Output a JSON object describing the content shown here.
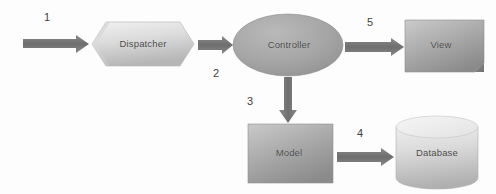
{
  "diagram": {
    "background_color": "#fdfdfd",
    "arrow_color": "#6b6b6b",
    "text_color": "#4a4a4a",
    "nodes": [
      {
        "id": "dispatcher",
        "label": "Dispatcher",
        "shape": "hexagon"
      },
      {
        "id": "controller",
        "label": "Controller",
        "shape": "ellipse"
      },
      {
        "id": "view",
        "label": "View",
        "shape": "box-3d"
      },
      {
        "id": "model",
        "label": "Model",
        "shape": "rectangle"
      },
      {
        "id": "database",
        "label": "Database",
        "shape": "cylinder"
      }
    ],
    "connectors": [
      {
        "id": "arrow-1",
        "number": "1",
        "from": "input",
        "to": "dispatcher",
        "direction": "right"
      },
      {
        "id": "arrow-2",
        "number": "2",
        "from": "dispatcher",
        "to": "controller",
        "direction": "right"
      },
      {
        "id": "arrow-3",
        "number": "3",
        "from": "controller",
        "to": "model",
        "direction": "down"
      },
      {
        "id": "arrow-4",
        "number": "4",
        "from": "model",
        "to": "database",
        "direction": "right"
      },
      {
        "id": "arrow-5",
        "number": "5",
        "from": "controller",
        "to": "view",
        "direction": "right"
      }
    ]
  }
}
